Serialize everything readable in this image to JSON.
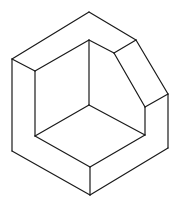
{
  "figure": {
    "type": "isometric-line-drawing",
    "stroke_color": "#1a1a1a",
    "background": "#ffffff",
    "vertices": {
      "top": [
        89,
        12
      ],
      "outer_left_top": [
        12,
        59
      ],
      "outer_left_bottom": [
        12,
        151
      ],
      "bottom": [
        90,
        195
      ],
      "outer_right_bottom": [
        168,
        148
      ],
      "outer_right_top": [
        168,
        94
      ],
      "chamfer_top_right": [
        136,
        40
      ],
      "chamfer_top_left": [
        114,
        53
      ],
      "chamfer_bottom_left": [
        145,
        107
      ],
      "inner_left_top": [
        35,
        71
      ],
      "inner_top": [
        89,
        40
      ],
      "inner_center": [
        89,
        105
      ],
      "inner_left_bottom": [
        35,
        136
      ],
      "inner_right_bottom": [
        145,
        135
      ],
      "inner_bottom": [
        90,
        167
      ]
    }
  }
}
